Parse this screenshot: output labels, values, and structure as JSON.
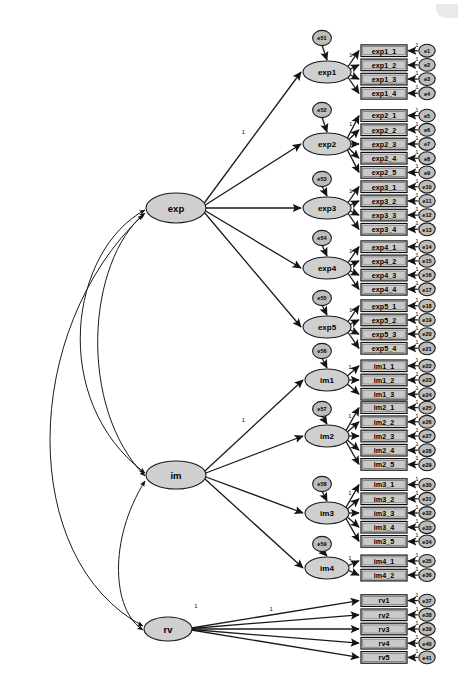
{
  "figure": {
    "type": "sem-path-diagram",
    "title": "",
    "background_color": "#ffffff",
    "latent_fill": "#cfcfcf",
    "indicator_fill": "#c9c9c9",
    "error_fill": "#bdbdbd",
    "stroke_color": "#1a1a1a",
    "fixed_loading_label": "1"
  },
  "exogenous_latents": [
    {
      "id": "exp",
      "label": "exp",
      "cx": 176,
      "cy": 208,
      "rx": 30,
      "ry": 15
    },
    {
      "id": "im",
      "label": "im",
      "cx": 176,
      "cy": 475,
      "rx": 30,
      "ry": 14
    },
    {
      "id": "rv",
      "label": "rv",
      "cx": 168,
      "cy": 629,
      "rx": 24,
      "ry": 12
    }
  ],
  "constructs": [
    {
      "id": "exp1",
      "label": "exp1",
      "cx": 327,
      "cy": 72,
      "rx": 24,
      "ry": 11,
      "parent": "exp",
      "disturbance": {
        "label": "e51",
        "cx": 322,
        "cy": 38,
        "r": 10
      },
      "indicators": [
        {
          "label": "exp1_1",
          "error": "e1"
        },
        {
          "label": "exp1_2",
          "error": "e2"
        },
        {
          "label": "exp1_3",
          "error": "e3"
        },
        {
          "label": "exp1_4",
          "error": "e4"
        }
      ]
    },
    {
      "id": "exp2",
      "label": "exp2",
      "cx": 327,
      "cy": 144,
      "rx": 24,
      "ry": 11,
      "parent": "exp",
      "disturbance": {
        "label": "e52",
        "cx": 322,
        "cy": 110,
        "r": 10
      },
      "indicators": [
        {
          "label": "exp2_1",
          "error": "e5"
        },
        {
          "label": "exp2_2",
          "error": "e6"
        },
        {
          "label": "exp2_3",
          "error": "e7"
        },
        {
          "label": "exp2_4",
          "error": "e8"
        },
        {
          "label": "exp2_5",
          "error": "e9"
        }
      ]
    },
    {
      "id": "exp3",
      "label": "exp3",
      "cx": 327,
      "cy": 208,
      "rx": 24,
      "ry": 11,
      "parent": "exp",
      "disturbance": {
        "label": "e53",
        "cx": 322,
        "cy": 179,
        "r": 10
      },
      "indicators": [
        {
          "label": "exp3_1",
          "error": "e10"
        },
        {
          "label": "exp3_2",
          "error": "e11"
        },
        {
          "label": "exp3_3",
          "error": "e12"
        },
        {
          "label": "exp3_4",
          "error": "e13"
        }
      ]
    },
    {
      "id": "exp4",
      "label": "exp4",
      "cx": 327,
      "cy": 268,
      "rx": 24,
      "ry": 11,
      "parent": "exp",
      "disturbance": {
        "label": "e54",
        "cx": 322,
        "cy": 238,
        "r": 10
      },
      "indicators": [
        {
          "label": "exp4_1",
          "error": "e14"
        },
        {
          "label": "exp4_2",
          "error": "e15"
        },
        {
          "label": "exp4_3",
          "error": "e16"
        },
        {
          "label": "exp4_4",
          "error": "e17"
        }
      ]
    },
    {
      "id": "exp5",
      "label": "exp5",
      "cx": 327,
      "cy": 327,
      "rx": 24,
      "ry": 11,
      "parent": "exp",
      "disturbance": {
        "label": "e55",
        "cx": 322,
        "cy": 298,
        "r": 10
      },
      "indicators": [
        {
          "label": "exp5_1",
          "error": "e18"
        },
        {
          "label": "exp5_2",
          "error": "e19"
        },
        {
          "label": "exp5_3",
          "error": "e20"
        },
        {
          "label": "exp5_4",
          "error": "e21"
        }
      ]
    },
    {
      "id": "im1",
      "label": "im1",
      "cx": 327,
      "cy": 380,
      "rx": 22,
      "ry": 11,
      "parent": "im",
      "disturbance": {
        "label": "e56",
        "cx": 322,
        "cy": 351,
        "r": 10
      },
      "indicators": [
        {
          "label": "im1_1",
          "error": "e22"
        },
        {
          "label": "im1_2",
          "error": "e23"
        },
        {
          "label": "im1_3",
          "error": "e24"
        }
      ]
    },
    {
      "id": "im2",
      "label": "im2",
      "cx": 327,
      "cy": 436,
      "rx": 22,
      "ry": 11,
      "parent": "im",
      "disturbance": {
        "label": "e57",
        "cx": 322,
        "cy": 409,
        "r": 10
      },
      "indicators": [
        {
          "label": "im2_1",
          "error": "e25"
        },
        {
          "label": "im2_2",
          "error": "e26"
        },
        {
          "label": "im2_3",
          "error": "e27"
        },
        {
          "label": "im2_4",
          "error": "e28"
        },
        {
          "label": "im2_5",
          "error": "e29"
        }
      ]
    },
    {
      "id": "im3",
      "label": "im3",
      "cx": 327,
      "cy": 513,
      "rx": 22,
      "ry": 11,
      "parent": "im",
      "disturbance": {
        "label": "e58",
        "cx": 322,
        "cy": 484,
        "r": 10
      },
      "indicators": [
        {
          "label": "im3_1",
          "error": "e30"
        },
        {
          "label": "im3_2",
          "error": "e31"
        },
        {
          "label": "im3_3",
          "error": "e32"
        },
        {
          "label": "im3_4",
          "error": "e33"
        },
        {
          "label": "im3_5",
          "error": "e34"
        }
      ]
    },
    {
      "id": "im4",
      "label": "im4",
      "cx": 327,
      "cy": 568,
      "rx": 22,
      "ry": 11,
      "parent": "im",
      "disturbance": {
        "label": "e59",
        "cx": 322,
        "cy": 544,
        "r": 10
      },
      "indicators": [
        {
          "label": "im4_1",
          "error": "e35"
        },
        {
          "label": "im4_2",
          "error": "e36"
        }
      ]
    },
    {
      "id": "rvgroup",
      "label": "rv",
      "cx": 168,
      "cy": 629,
      "rx": 24,
      "ry": 12,
      "parent": null,
      "disturbance": null,
      "indicators": [
        {
          "label": "rv1",
          "error": "e37"
        },
        {
          "label": "rv2",
          "error": "e38"
        },
        {
          "label": "rv3",
          "error": "e39"
        },
        {
          "label": "rv4",
          "error": "e40"
        },
        {
          "label": "rv5",
          "error": "e41"
        }
      ]
    }
  ],
  "covariance_curves": [
    {
      "from": "exp",
      "to": "im",
      "note": "exp-im curved double-headed path (outer)"
    },
    {
      "from": "exp",
      "to": "im",
      "note": "exp-im curved double-headed path (inner)"
    },
    {
      "from": "exp",
      "to": "rv",
      "note": "exp-rv curved double-headed path"
    },
    {
      "from": "im",
      "to": "rv",
      "note": "im-rv curved double-headed path"
    }
  ]
}
